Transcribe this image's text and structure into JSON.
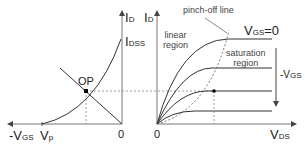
{
  "left_plot": {
    "title": "Transfer characteristic",
    "y_axis_label": "I",
    "y_axis_sub": "D",
    "x_axis_label": "-V",
    "x_axis_sub": "GS",
    "origin_label": "0",
    "idss_label": "I",
    "idss_sub": "DSS",
    "vp_label": "V",
    "vp_sub": "p",
    "op_label": "OP"
  },
  "right_plot": {
    "title": "Output characteristic",
    "y_axis_label": "I",
    "y_axis_sub": "D",
    "x_axis_label": "V",
    "x_axis_sub": "DS",
    "origin_label": "0",
    "pinch_off_label": "pinch-off line",
    "linear_region_line1": "linear",
    "linear_region_line2": "region",
    "saturation_region_line1": "saturation",
    "saturation_region_line2": "region",
    "vgs0_label": "V",
    "vgs0_sub": "GS",
    "vgs0_value": "=0",
    "neg_vgs_label": "-V",
    "neg_vgs_sub": "GS"
  },
  "colors": {
    "axis": "#555555",
    "curve": "#333333",
    "dashed": "#777777",
    "point": "#000000"
  }
}
